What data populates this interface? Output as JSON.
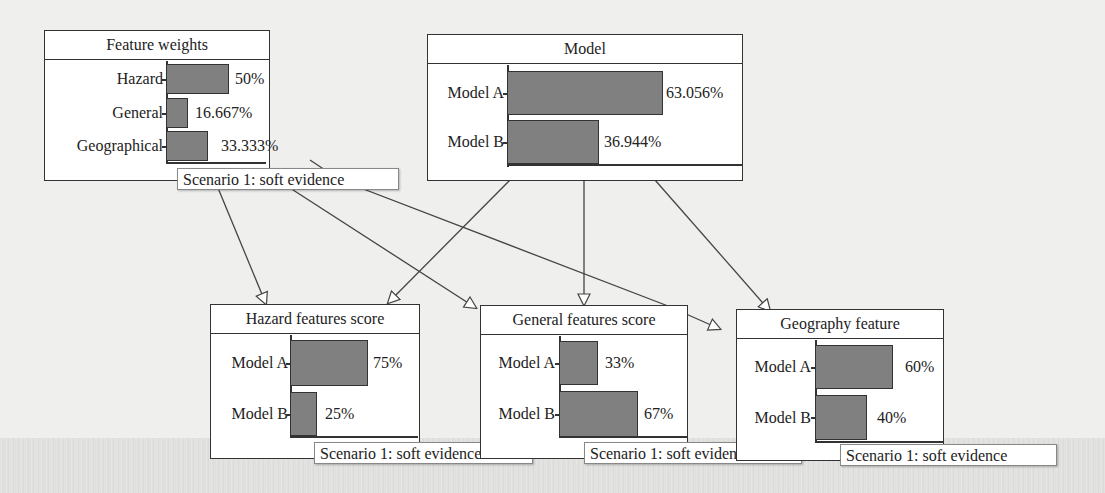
{
  "nodes": {
    "feature_weights": {
      "title": "Feature weights",
      "states": [
        {
          "label": "Hazard",
          "value": "50%",
          "pct": 50
        },
        {
          "label": "General",
          "value": "16.667%",
          "pct": 16.667
        },
        {
          "label": "Geographical",
          "value": "33.333%",
          "pct": 33.333
        }
      ],
      "evidence": "Scenario 1: soft evidence"
    },
    "model": {
      "title": "Model",
      "states": [
        {
          "label": "Model A",
          "value": "63.056%",
          "pct": 63.056
        },
        {
          "label": "Model B",
          "value": "36.944%",
          "pct": 36.944
        }
      ]
    },
    "hazard_features_score": {
      "title": "Hazard features score",
      "states": [
        {
          "label": "Model A",
          "value": "75%",
          "pct": 75
        },
        {
          "label": "Model B",
          "value": "25%",
          "pct": 25
        }
      ],
      "evidence": "Scenario 1: soft evidence"
    },
    "general_features_score": {
      "title": "General features score",
      "states": [
        {
          "label": "Model A",
          "value": "33%",
          "pct": 33
        },
        {
          "label": "Model B",
          "value": "67%",
          "pct": 67
        }
      ],
      "evidence": "Scenario 1: soft evidence"
    },
    "geography_feature": {
      "title": "Geography feature",
      "states": [
        {
          "label": "Model A",
          "value": "60%",
          "pct": 60
        },
        {
          "label": "Model B",
          "value": "40%",
          "pct": 40
        }
      ],
      "evidence": "Scenario 1: soft evidence"
    }
  },
  "edges": [
    {
      "from": "Feature weights",
      "to": "Hazard features score"
    },
    {
      "from": "Feature weights",
      "to": "General features score"
    },
    {
      "from": "Feature weights",
      "to": "Geography feature"
    },
    {
      "from": "Model",
      "to": "Hazard features score"
    },
    {
      "from": "Model",
      "to": "General features score"
    },
    {
      "from": "Model",
      "to": "Geography feature"
    }
  ],
  "colors": {
    "bar_fill": "#808080",
    "border": "#333333",
    "background": "#efefed"
  }
}
